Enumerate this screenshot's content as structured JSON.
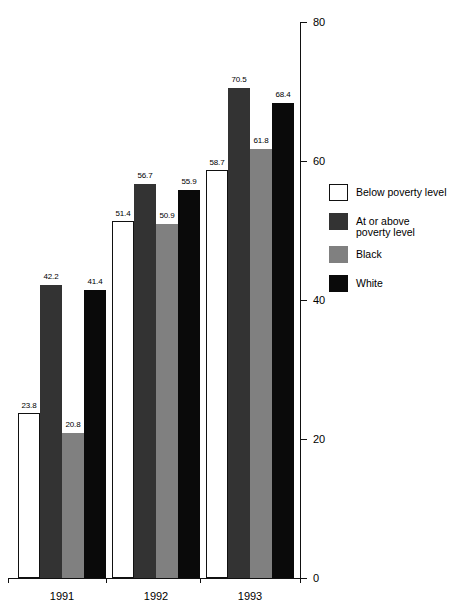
{
  "chart_data": {
    "type": "bar",
    "title": "",
    "xlabel": "",
    "ylabel": "",
    "categories": [
      "1991",
      "1992",
      "1993"
    ],
    "ylim": [
      0,
      80
    ],
    "yticks": [
      0,
      20,
      40,
      60,
      80
    ],
    "ytick_labels": [
      "0",
      "20",
      "40",
      "60",
      "80"
    ],
    "grid": false,
    "legend_position": "right",
    "series": [
      {
        "name": "Below poverty level",
        "color": "#ffffff",
        "values": [
          23.8,
          51.4,
          58.7
        ],
        "labels": [
          "23.8",
          "51.4",
          "58.7"
        ]
      },
      {
        "name": "At or above\npoverty level",
        "color": "#333333",
        "values": [
          42.2,
          56.7,
          70.5
        ],
        "labels": [
          "42.2",
          "56.7",
          "70.5"
        ]
      },
      {
        "name": "Black",
        "color": "#808080",
        "values": [
          20.8,
          50.9,
          61.8
        ],
        "labels": [
          "20.8",
          "50.9",
          "61.8"
        ]
      },
      {
        "name": "White",
        "color": "#0a0a0a",
        "values": [
          41.4,
          55.9,
          68.4
        ],
        "labels": [
          "41.4",
          "55.9",
          "68.4"
        ]
      }
    ]
  },
  "axis": {
    "y_tick_0": "0",
    "y_tick_20": "20",
    "y_tick_40": "40",
    "y_tick_60": "60",
    "y_tick_80": "80",
    "x_tick_1991": "1991",
    "x_tick_1992": "1992",
    "x_tick_1993": "1993"
  },
  "legend": {
    "items": [
      {
        "label": "Below poverty level",
        "color": "#ffffff"
      },
      {
        "label": "At or above\npoverty level",
        "color": "#333333"
      },
      {
        "label": "Black",
        "color": "#808080"
      },
      {
        "label": "White",
        "color": "#0a0a0a"
      }
    ]
  }
}
